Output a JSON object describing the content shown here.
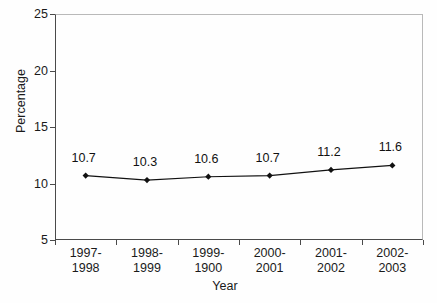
{
  "chart_data": {
    "type": "line",
    "title": "",
    "xlabel": "Year",
    "ylabel": "Percentage",
    "categories": [
      "1997-1998",
      "1998-1999",
      "1999-1900",
      "2000-2001",
      "2001-2002",
      "2002-2003"
    ],
    "category_lines": [
      [
        "1997-",
        "1998"
      ],
      [
        "1998-",
        "1999"
      ],
      [
        "1999-",
        "1900"
      ],
      [
        "2000-",
        "2001"
      ],
      [
        "2001-",
        "2002"
      ],
      [
        "2002-",
        "2003"
      ]
    ],
    "values": [
      10.7,
      10.3,
      10.6,
      10.7,
      11.2,
      11.6
    ],
    "point_labels": [
      "10.7",
      "10.3",
      "10.6",
      "10.7",
      "11.2",
      "11.6"
    ],
    "ylim": [
      5,
      25
    ],
    "yticks": [
      5,
      10,
      15,
      20,
      25
    ],
    "ytick_labels": [
      "5",
      "10",
      "15",
      "20",
      "25"
    ],
    "grid": false,
    "legend": false,
    "marker": "diamond",
    "series_color": "#111111",
    "axis_color": "#4a4a4a",
    "frame_color": "#b9b9b9",
    "background_color": "#fefefe"
  }
}
